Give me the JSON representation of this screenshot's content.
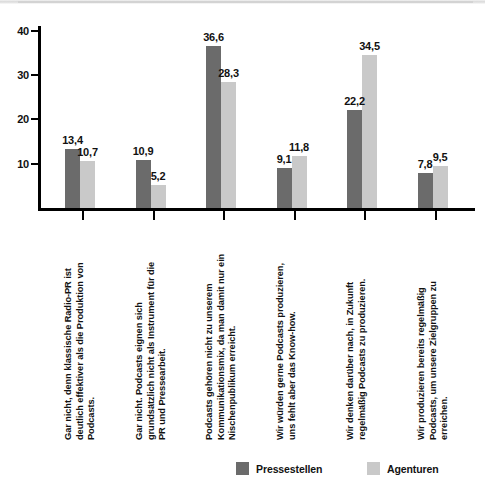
{
  "chart_data": {
    "type": "bar",
    "title": "",
    "subtitle": "",
    "xlabel": "",
    "ylabel": "",
    "ylim": [
      0,
      40
    ],
    "yticks": [
      10,
      20,
      30,
      40
    ],
    "ytick_labels": [
      "10",
      "20",
      "30",
      "40"
    ],
    "grid": false,
    "legend_position": "bottom",
    "value_label_format": "comma-decimal",
    "categories": [
      "Gar nicht, denn klassische Radio-PR ist\ndeutlich effektiver als die Produktion von\nPodcasts.",
      "Gar nicht. Podcasts eignen sich\ngrundsätzlich nicht als Instrument für die\nPR und Pressearbeit.",
      "Podcasts gehören nicht zu unserem\nKommunikationsmix, da man damit nur ein\nNischenpublikum erreicht.",
      "Wir würden gerne Podcasts produzieren,\nuns fehlt aber das Know-how.",
      "Wir denken darüber nach, in Zukunft\nregelmäßig Podcasts zu produzieren.",
      "Wir produzieren bereits regelmäßig\nPodcasts, um unsere Zielgruppen zu\nerreichen."
    ],
    "series": [
      {
        "name": "Pressestellen",
        "color": "#6b6b6b",
        "values": [
          13.4,
          10.9,
          36.6,
          9.1,
          22.2,
          7.8
        ],
        "value_labels": [
          "13,4",
          "10,9",
          "36,6",
          "9,1",
          "22,2",
          "7,8"
        ]
      },
      {
        "name": "Agenturen",
        "color": "#c9c9c9",
        "values": [
          10.7,
          5.2,
          28.3,
          11.8,
          34.5,
          9.5
        ],
        "value_labels": [
          "10,7",
          "5,2",
          "28,3",
          "11,8",
          "34,5",
          "9,5"
        ]
      }
    ]
  },
  "legend": {
    "items": [
      {
        "label": "Pressestellen",
        "color": "#6b6b6b",
        "swatch": "dark"
      },
      {
        "label": "Agenturen",
        "color": "#c9c9c9",
        "swatch": "light"
      }
    ]
  }
}
